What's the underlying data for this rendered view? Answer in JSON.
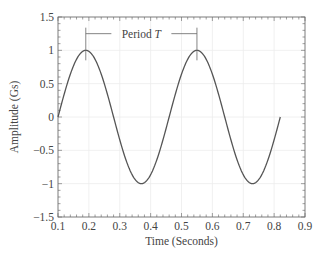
{
  "chart_data": {
    "type": "line",
    "title": "",
    "xlabel": "Time (Seconds)",
    "ylabel": "Amplitude (Gs)",
    "xlim": [
      0.1,
      0.9
    ],
    "ylim": [
      -1.5,
      1.5
    ],
    "xticks": [
      0.1,
      0.2,
      0.3,
      0.4,
      0.5,
      0.6,
      0.7,
      0.8,
      0.9
    ],
    "xtick_labels": [
      "0.1",
      "0.2",
      "0.3",
      "0.4",
      "0.5",
      "0.6",
      "0.7",
      "0.8",
      "0.9"
    ],
    "yticks": [
      -1.5,
      -1,
      -0.5,
      0,
      0.5,
      1,
      1.5
    ],
    "ytick_labels": [
      "−1.5",
      "−1",
      "−0.5",
      "0",
      "0.5",
      "1",
      "1.5"
    ],
    "x_minor_step": 0.02,
    "y_minor_step": 0.1,
    "grid": true,
    "legend": null,
    "series": [
      {
        "name": "Sine wave",
        "function": "sin(2*pi*(t-0.10)/0.36)",
        "x_start": 0.1,
        "x_end": 0.82,
        "period": 0.36,
        "amplitude": 1,
        "points": [
          [
            0.1,
            0
          ],
          [
            0.19,
            1
          ],
          [
            0.28,
            0
          ],
          [
            0.37,
            -1
          ],
          [
            0.46,
            0
          ],
          [
            0.55,
            1
          ],
          [
            0.64,
            0
          ],
          [
            0.73,
            -1
          ],
          [
            0.82,
            0
          ]
        ],
        "color": "#555555"
      }
    ],
    "annotations": [
      {
        "text": "Period ",
        "italic_suffix": "T",
        "x_from": 0.19,
        "x_to": 0.55,
        "y": 1.25
      }
    ]
  }
}
